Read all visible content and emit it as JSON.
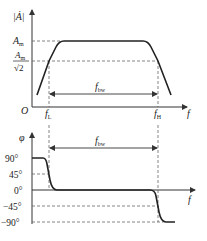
{
  "magnitude_plot": {
    "y_axis_label": "|Ȧ|",
    "x_axis_label": "f",
    "origin_label": "O",
    "level_max_label": "A",
    "level_max_sub": "m",
    "level_half_num": "A",
    "level_half_num_sub": "m",
    "level_half_den": "√2",
    "f_low_label": "f",
    "f_low_sub": "L",
    "f_high_label": "f",
    "f_high_sub": "H",
    "bandwidth_label": "f",
    "bandwidth_sub": "bw"
  },
  "phase_plot": {
    "y_axis_label": "φ",
    "x_axis_label": "f",
    "ticks": [
      "90°",
      "45°",
      "0°",
      "−45°",
      "−90°"
    ],
    "bandwidth_label": "f",
    "bandwidth_sub": "bw"
  },
  "colors": {
    "curve": "#222222",
    "axis": "#333333",
    "dashed": "#666666",
    "background": "#ffffff"
  }
}
